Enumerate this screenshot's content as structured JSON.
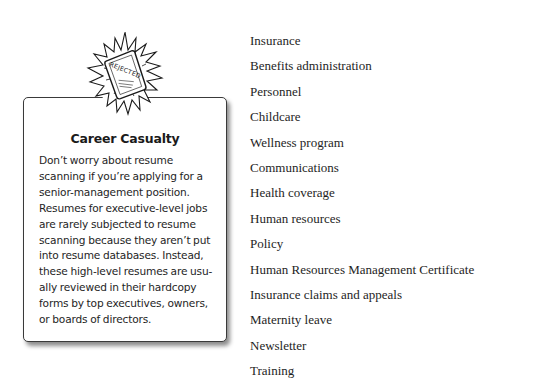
{
  "sidebar": {
    "icon": "rejected-stamp-icon",
    "icon_stamp_text": "REJECTED",
    "title": "Career Casualty",
    "body_lines": [
      "Don’t worry about resume",
      "scanning if you’re applying for a",
      "senior-management position.",
      "Resumes for executive-level jobs",
      "are rarely subjected to resume",
      "scanning because they aren’t put",
      "into resume databases. Instead,",
      "these high-level resumes are usu-",
      "ally reviewed in their hardcopy",
      "forms by top executives, owners,",
      "or boards of directors."
    ]
  },
  "terms": [
    "Insurance",
    "Benefits administration",
    "Personnel",
    "Childcare",
    "Wellness program",
    "Communications",
    "Health coverage",
    "Human resources",
    "Policy",
    "Human Resources Management Certificate",
    "Insurance claims and appeals",
    "Maternity leave",
    "Newsletter",
    "Training"
  ]
}
